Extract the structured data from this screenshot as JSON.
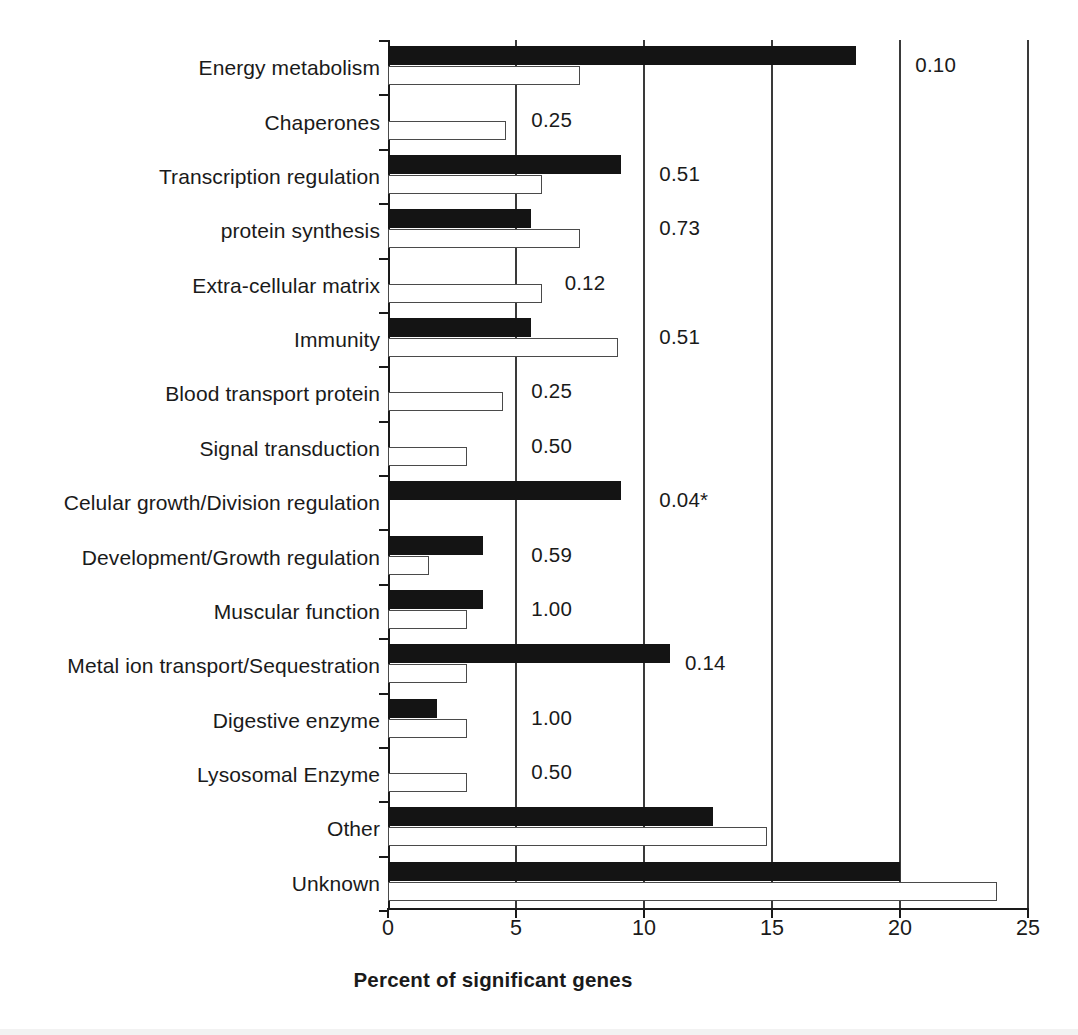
{
  "chart_data": {
    "type": "bar",
    "orientation": "horizontal",
    "title": "",
    "xlabel": "Percent of significant genes",
    "ylabel": "",
    "xlim": [
      0,
      25
    ],
    "xticks": [
      0,
      5,
      10,
      15,
      20,
      25
    ],
    "xtick_labels": [
      "0",
      "5",
      "10",
      "15",
      "20",
      "25"
    ],
    "grid": "vertical gridlines at 5, 10, 15, 20, 25",
    "legend": [],
    "categories": [
      "Energy metabolism",
      "Chaperones",
      "Transcription regulation",
      "protein synthesis",
      "Extra-cellular matrix",
      "Immunity",
      "Blood transport protein",
      "Signal transduction",
      "Celular growth/Division regulation",
      "Development/Growth regulation",
      "Muscular function",
      "Metal ion transport/Sequestration",
      "Digestive enzyme",
      "Lysosomal Enzyme",
      "Other",
      "Unknown"
    ],
    "series": [
      {
        "name": "black",
        "fill": "#141414",
        "values": [
          18.3,
          0,
          9.1,
          5.6,
          0,
          5.6,
          0,
          0,
          9.1,
          3.7,
          3.7,
          11.0,
          1.9,
          0,
          12.7,
          20.0
        ]
      },
      {
        "name": "white",
        "fill": "#ffffff",
        "values": [
          7.5,
          4.6,
          6.0,
          7.5,
          6.0,
          9.0,
          4.5,
          3.1,
          0,
          1.6,
          3.1,
          3.1,
          3.1,
          3.1,
          14.8,
          23.8
        ]
      }
    ],
    "annotations": [
      "0.10",
      "0.25",
      "0.51",
      "0.73",
      "0.12",
      "0.51",
      "0.25",
      "0.50",
      "0.04*",
      "0.59",
      "1.00",
      "0.14",
      "1.00",
      "0.50",
      "",
      ""
    ],
    "annotation_x": [
      20.6,
      5.6,
      10.6,
      10.6,
      6.9,
      10.6,
      5.6,
      5.6,
      10.6,
      5.6,
      5.6,
      11.6,
      5.6,
      5.6,
      null,
      null
    ]
  }
}
